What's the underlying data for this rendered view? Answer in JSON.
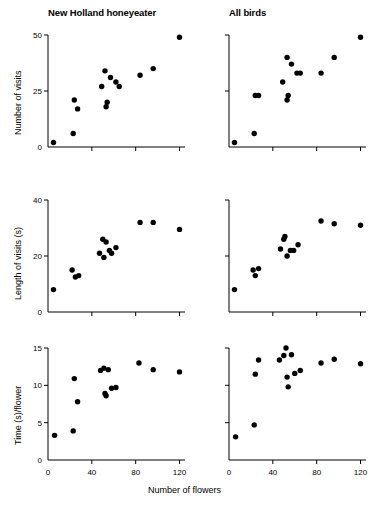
{
  "figure": {
    "xlabel": "Number of flowers",
    "columns": [
      {
        "title": "New Holland honeyeater"
      },
      {
        "title": "All birds"
      }
    ],
    "rows": [
      {
        "ylabel": "Number of visits"
      },
      {
        "ylabel": "Length of visits (s)"
      },
      {
        "ylabel": "Time (s)/flower"
      }
    ]
  },
  "chart_data": [
    {
      "type": "scatter",
      "title": "New Holland honeyeater",
      "panel": "row1-col1",
      "xlabel": "Number of flowers",
      "ylabel": "Number of visits",
      "xlim": [
        0,
        125
      ],
      "ylim": [
        0,
        50
      ],
      "xticks": [
        0,
        40,
        80,
        120
      ],
      "yticks": [
        0,
        25,
        50
      ],
      "xticklabels": [
        "0",
        "40",
        "80",
        "120"
      ],
      "yticklabels": [
        "0",
        "25",
        "50"
      ],
      "grid": false,
      "legend": "none",
      "marker": "filled-circle",
      "color": "#000000",
      "points": [
        {
          "x": 5,
          "y": 2
        },
        {
          "x": 23,
          "y": 6
        },
        {
          "x": 24,
          "y": 21
        },
        {
          "x": 27,
          "y": 17
        },
        {
          "x": 49,
          "y": 27
        },
        {
          "x": 52,
          "y": 34
        },
        {
          "x": 53,
          "y": 18
        },
        {
          "x": 54,
          "y": 20
        },
        {
          "x": 57,
          "y": 31
        },
        {
          "x": 62,
          "y": 29
        },
        {
          "x": 65,
          "y": 27
        },
        {
          "x": 84,
          "y": 32
        },
        {
          "x": 96,
          "y": 35
        },
        {
          "x": 120,
          "y": 49
        }
      ]
    },
    {
      "type": "scatter",
      "title": "All birds",
      "panel": "row1-col2",
      "xlabel": "Number of flowers",
      "ylabel": "Number of visits",
      "xlim": [
        0,
        125
      ],
      "ylim": [
        0,
        50
      ],
      "xticks": [
        0,
        40,
        80,
        120
      ],
      "yticks": [
        0,
        25,
        50
      ],
      "xticklabels": [
        "0",
        "40",
        "80",
        "120"
      ],
      "yticklabels": [],
      "grid": false,
      "legend": "none",
      "marker": "filled-circle",
      "color": "#000000",
      "points": [
        {
          "x": 5,
          "y": 2
        },
        {
          "x": 23,
          "y": 6
        },
        {
          "x": 24,
          "y": 23
        },
        {
          "x": 27,
          "y": 23
        },
        {
          "x": 49,
          "y": 29
        },
        {
          "x": 53,
          "y": 40
        },
        {
          "x": 53,
          "y": 21
        },
        {
          "x": 54,
          "y": 23
        },
        {
          "x": 57,
          "y": 37
        },
        {
          "x": 62,
          "y": 33
        },
        {
          "x": 65,
          "y": 33
        },
        {
          "x": 84,
          "y": 33
        },
        {
          "x": 96,
          "y": 40
        },
        {
          "x": 120,
          "y": 49
        }
      ]
    },
    {
      "type": "scatter",
      "title": "New Holland honeyeater",
      "panel": "row2-col1",
      "xlabel": "Number of flowers",
      "ylabel": "Length of visits (s)",
      "xlim": [
        0,
        125
      ],
      "ylim": [
        0,
        40
      ],
      "xticks": [
        0,
        40,
        80,
        120
      ],
      "yticks": [
        0,
        20,
        40
      ],
      "xticklabels": [
        "0",
        "40",
        "80",
        "120"
      ],
      "yticklabels": [
        "0",
        "20",
        "40"
      ],
      "grid": false,
      "legend": "none",
      "marker": "filled-circle",
      "color": "#000000",
      "points": [
        {
          "x": 5,
          "y": 8
        },
        {
          "x": 22,
          "y": 15
        },
        {
          "x": 25,
          "y": 12.5
        },
        {
          "x": 28,
          "y": 13
        },
        {
          "x": 47,
          "y": 21
        },
        {
          "x": 50,
          "y": 26
        },
        {
          "x": 51,
          "y": 19.5
        },
        {
          "x": 53,
          "y": 25
        },
        {
          "x": 56,
          "y": 22
        },
        {
          "x": 58,
          "y": 21
        },
        {
          "x": 62,
          "y": 23
        },
        {
          "x": 84,
          "y": 32
        },
        {
          "x": 96,
          "y": 32
        },
        {
          "x": 120,
          "y": 29.5
        }
      ]
    },
    {
      "type": "scatter",
      "title": "All birds",
      "panel": "row2-col2",
      "xlabel": "Number of flowers",
      "ylabel": "Length of visits (s)",
      "xlim": [
        0,
        125
      ],
      "ylim": [
        0,
        40
      ],
      "xticks": [
        0,
        40,
        80,
        120
      ],
      "yticks": [
        0,
        20,
        40
      ],
      "xticklabels": [
        "0",
        "40",
        "80",
        "120"
      ],
      "yticklabels": [],
      "grid": false,
      "legend": "none",
      "marker": "filled-circle",
      "color": "#000000",
      "points": [
        {
          "x": 5,
          "y": 8
        },
        {
          "x": 22,
          "y": 15
        },
        {
          "x": 24,
          "y": 13
        },
        {
          "x": 27,
          "y": 15.5
        },
        {
          "x": 47,
          "y": 22.5
        },
        {
          "x": 50,
          "y": 26
        },
        {
          "x": 51,
          "y": 27
        },
        {
          "x": 53,
          "y": 20
        },
        {
          "x": 56,
          "y": 22
        },
        {
          "x": 59,
          "y": 22
        },
        {
          "x": 63,
          "y": 24
        },
        {
          "x": 84,
          "y": 32.5
        },
        {
          "x": 96,
          "y": 31.5
        },
        {
          "x": 120,
          "y": 31
        }
      ]
    },
    {
      "type": "scatter",
      "title": "New Holland honeyeater",
      "panel": "row3-col1",
      "xlabel": "Number of flowers",
      "ylabel": "Time (s)/flower",
      "xlim": [
        0,
        125
      ],
      "ylim": [
        0,
        15
      ],
      "xticks": [
        0,
        40,
        80,
        120
      ],
      "yticks": [
        0,
        5,
        10,
        15
      ],
      "xticklabels": [
        "0",
        "40",
        "80",
        "120"
      ],
      "yticklabels": [
        "0",
        "5",
        "10",
        "15"
      ],
      "grid": false,
      "legend": "none",
      "marker": "filled-circle",
      "color": "#000000",
      "points": [
        {
          "x": 6,
          "y": 3.3
        },
        {
          "x": 23,
          "y": 3.9
        },
        {
          "x": 24,
          "y": 10.9
        },
        {
          "x": 27,
          "y": 7.8
        },
        {
          "x": 48,
          "y": 12.0
        },
        {
          "x": 51,
          "y": 12.3
        },
        {
          "x": 52,
          "y": 8.9
        },
        {
          "x": 53,
          "y": 8.6
        },
        {
          "x": 55,
          "y": 12.1
        },
        {
          "x": 58,
          "y": 9.6
        },
        {
          "x": 62,
          "y": 9.7
        },
        {
          "x": 83,
          "y": 13.0
        },
        {
          "x": 96,
          "y": 12.1
        },
        {
          "x": 120,
          "y": 11.8
        }
      ]
    },
    {
      "type": "scatter",
      "title": "All birds",
      "panel": "row3-col2",
      "xlabel": "Number of flowers",
      "ylabel": "Time (s)/flower",
      "xlim": [
        0,
        125
      ],
      "ylim": [
        0,
        15
      ],
      "xticks": [
        0,
        40,
        80,
        120
      ],
      "yticks": [
        0,
        5,
        10,
        15
      ],
      "xticklabels": [
        "0",
        "40",
        "80",
        "120"
      ],
      "yticklabels": [],
      "grid": false,
      "legend": "none",
      "marker": "filled-circle",
      "color": "#000000",
      "points": [
        {
          "x": 6,
          "y": 3.1
        },
        {
          "x": 23,
          "y": 4.7
        },
        {
          "x": 24,
          "y": 11.5
        },
        {
          "x": 27,
          "y": 13.4
        },
        {
          "x": 46,
          "y": 13.4
        },
        {
          "x": 50,
          "y": 14.0
        },
        {
          "x": 52,
          "y": 15.0
        },
        {
          "x": 53,
          "y": 11.1
        },
        {
          "x": 54,
          "y": 9.8
        },
        {
          "x": 57,
          "y": 14.1
        },
        {
          "x": 60,
          "y": 11.6
        },
        {
          "x": 65,
          "y": 12.0
        },
        {
          "x": 84,
          "y": 13.0
        },
        {
          "x": 96,
          "y": 13.5
        },
        {
          "x": 120,
          "y": 12.9
        }
      ]
    }
  ]
}
